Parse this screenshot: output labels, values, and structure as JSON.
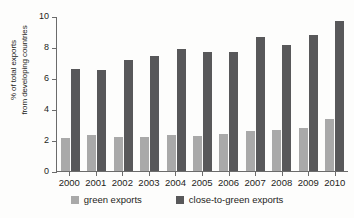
{
  "chart_data": {
    "type": "bar",
    "title": "",
    "xlabel": "",
    "ylabel": "% of total exports\nfrom developing countries",
    "categories": [
      "2000",
      "2001",
      "2002",
      "2003",
      "2004",
      "2005",
      "2006",
      "2007",
      "2008",
      "2009",
      "2010"
    ],
    "series": [
      {
        "name": "green exports",
        "color": "#a9a9a9",
        "values": [
          2.1,
          2.3,
          2.2,
          2.2,
          2.3,
          2.25,
          2.4,
          2.55,
          2.65,
          2.8,
          3.35
        ]
      },
      {
        "name": "close-to-green exports",
        "color": "#58585a",
        "values": [
          6.55,
          6.5,
          7.15,
          7.45,
          7.85,
          7.7,
          7.65,
          8.65,
          8.15,
          8.8,
          9.65
        ]
      }
    ],
    "ylim": [
      0,
      10
    ],
    "yticks": [
      0,
      2,
      4,
      6,
      8,
      10
    ],
    "ytick_labels": [
      "0",
      "2",
      "4",
      "6",
      "8",
      "10"
    ],
    "grid": false,
    "legend_position": "bottom"
  },
  "legend": {
    "items": [
      {
        "label": "green exports"
      },
      {
        "label": "close-to-green exports"
      }
    ]
  }
}
